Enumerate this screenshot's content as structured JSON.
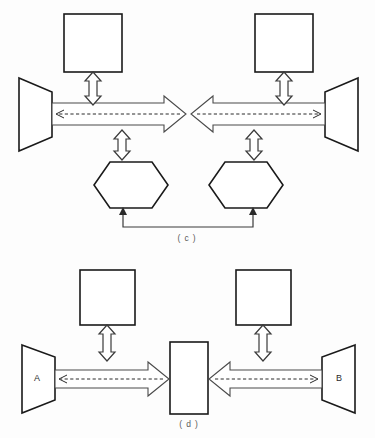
{
  "figure": {
    "background_color": "#fdfdfd",
    "line_color": "#1a1a1a",
    "arrow_color": "#4a4a4a",
    "dash_color": "#2a2a2a"
  },
  "panels": [
    {
      "id": "c",
      "caption": "( c )",
      "nodes": {
        "top_left_square_label": "",
        "top_right_square_label": "",
        "left_trapezoid_label": "",
        "right_trapezoid_label": "",
        "left_hexagon_label": "",
        "right_hexagon_label": ""
      }
    },
    {
      "id": "d",
      "caption": "( d )",
      "nodes": {
        "top_left_square_label": "",
        "top_right_square_label": "",
        "left_trapezoid_label": "A",
        "right_trapezoid_label": "B",
        "center_rectangle_label": ""
      }
    }
  ],
  "captions": {
    "panel_c": "( c )",
    "panel_d": "( d )"
  },
  "labels": {
    "node_a": "A",
    "node_b": "B"
  }
}
